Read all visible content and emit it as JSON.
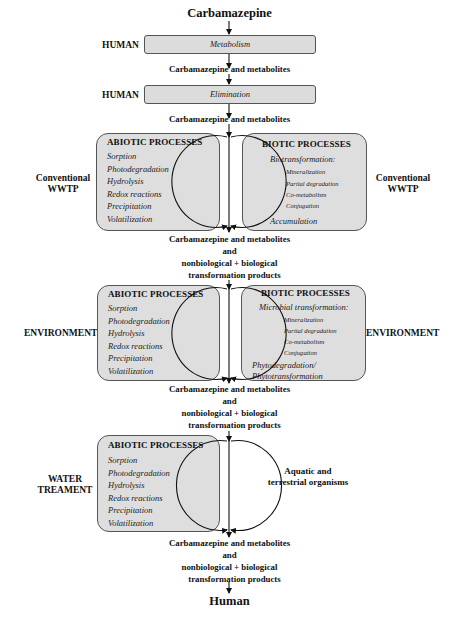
{
  "diagram": {
    "top_node": "Carbamazepine",
    "bottom_node": "Human",
    "human_stages": [
      {
        "side_label": "HUMAN",
        "process": "Metabolism"
      },
      {
        "side_label": "HUMAN",
        "process": "Elimination"
      }
    ],
    "intermediate_labels": {
      "after_metabolism": "Carbamazepine and metabolites",
      "after_elimination": "Carbamazepine and metabolites"
    },
    "transformation_output": {
      "line1": "Carbamazepine and metabolites",
      "line2": "and",
      "line3": "nonbiological + biological",
      "line4": "transformation products"
    },
    "sections": [
      {
        "left_label": {
          "line1": "Conventional",
          "line2": "WWTP"
        },
        "right_label": {
          "line1": "Conventional",
          "line2": "WWTP"
        },
        "abiotic": {
          "title": "ABIOTIC PROCESSES",
          "items": [
            "Sorption",
            "Photodegradation",
            "Hydrolysis",
            "Redox reactions",
            "Precipitation",
            "Volatilization"
          ]
        },
        "biotic": {
          "title": "BIOTIC PROCESSES",
          "heading": "Biotransformation:",
          "subitems": [
            "Mineralization",
            "Partial degradation",
            "Co-metabolism",
            "Conjugation"
          ],
          "footer": [
            "Accumulation"
          ]
        }
      },
      {
        "left_label": {
          "line1": "ENVIRONMENT"
        },
        "right_label": {
          "line1": "ENVIRONMENT"
        },
        "abiotic": {
          "title": "ABIOTIC PROCESSES",
          "items": [
            "Sorption",
            "Photodegradation",
            "Hydrolysis",
            "Redox reactions",
            "Precipitation",
            "Volatilization"
          ]
        },
        "biotic": {
          "title": "BIOTIC PROCESSES",
          "heading": "Microbial transformation:",
          "subitems": [
            "Mineralization",
            "Partial degradation",
            "Co-metabolism",
            "Conjugation"
          ],
          "footer": [
            "Phytodegradation/",
            "Phytotransformation"
          ]
        }
      },
      {
        "left_label": {
          "line1": "WATER",
          "line2": "TREAMENT"
        },
        "abiotic": {
          "title": "ABIOTIC PROCESSES",
          "items": [
            "Sorption",
            "Photodegradation",
            "Hydrolysis",
            "Redox reactions",
            "Precipitation",
            "Volatilization"
          ]
        },
        "right_text": {
          "line1": "Aquatic and",
          "line2": "terrestrial organisms"
        }
      }
    ]
  },
  "colors": {
    "box_fill": "#dedede",
    "box_border": "#555555",
    "line": "#111111",
    "background": "#ffffff"
  }
}
